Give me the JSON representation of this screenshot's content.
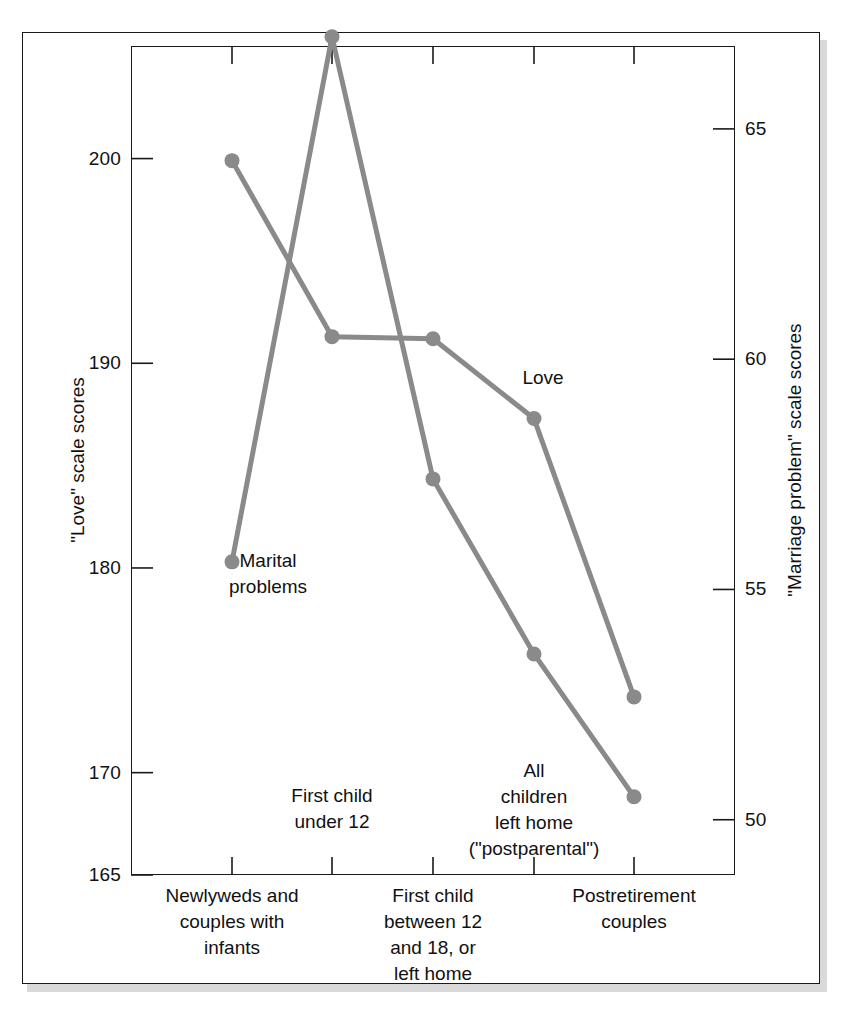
{
  "figure": {
    "background_color": "#ffffff",
    "frame_color": "#1a1a1a",
    "series_color": "#8a8a8a"
  },
  "left_axis": {
    "title": "\"Love\" scale scores",
    "ticks": [
      "200",
      "190",
      "180",
      "170",
      "165"
    ],
    "tick_values": [
      200,
      190,
      180,
      170,
      165
    ],
    "min": 165,
    "max": 205.5
  },
  "right_axis": {
    "title": "\"Marriage problem\" scale scores",
    "ticks": [
      "65",
      "60",
      "55",
      "50"
    ],
    "tick_values": [
      65,
      60,
      55,
      50
    ],
    "min": 48.8,
    "max": 66.8
  },
  "categories": [
    {
      "id": "c1",
      "label": "Newlyweds and\ncouples with\ninfants",
      "position": "below"
    },
    {
      "id": "c2",
      "label": "First child\nunder 12",
      "position": "above"
    },
    {
      "id": "c3",
      "label": "First child\nbetween 12\nand 18, or\nleft home",
      "position": "below"
    },
    {
      "id": "c4",
      "label": "All\nchildren\nleft home\n(\"postparental\")",
      "position": "above"
    },
    {
      "id": "c5",
      "label": "Postretirement\ncouples",
      "position": "below"
    }
  ],
  "series_labels": {
    "love": "Love",
    "marital": "Marital\nproblems"
  },
  "chart_data": {
    "type": "line",
    "title": "",
    "xlabel": "",
    "ylabel": "\"Love\" scale scores",
    "y2label": "\"Marriage problem\" scale scores",
    "grid": false,
    "legend": "inline-annotations",
    "categories": [
      "Newlyweds and couples with infants",
      "First child under 12",
      "First child between 12 and 18, or left home",
      "All children left home (\"postparental\")",
      "Postretirement couples"
    ],
    "ylim": [
      165,
      205.5
    ],
    "y2lim": [
      48.8,
      66.8
    ],
    "yticks": [
      165,
      170,
      180,
      190,
      200
    ],
    "y2ticks": [
      50,
      55,
      60,
      65
    ],
    "series": [
      {
        "name": "Love",
        "axis": "left",
        "values": [
          199.9,
          191.3,
          191.2,
          187.3,
          173.7
        ]
      },
      {
        "name": "Marital problems",
        "axis": "right",
        "values": [
          55.6,
          67.0,
          57.4,
          53.6,
          50.5
        ]
      }
    ]
  }
}
